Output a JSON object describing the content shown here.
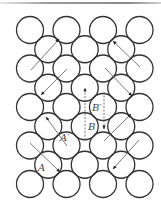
{
  "figure": {
    "title": "",
    "circle_radius": 13.5,
    "stroke_color": "#333333",
    "arrow_color": "#555555",
    "circles": {
      "main_rows_y": [
        30,
        68.5,
        107,
        145.5,
        184
      ],
      "main_rows_x": [
        30,
        66.5,
        103,
        139.5
      ],
      "offset_rows_y": [
        49.25,
        87.75,
        126.25,
        164.75
      ],
      "offset_rows_x": [
        48.25,
        84.75,
        121.25
      ]
    },
    "labels": [
      {
        "id": "A",
        "text": "A",
        "x": 38,
        "y": 171
      },
      {
        "id": "A-prime",
        "text": "A′",
        "x": 60,
        "y": 141
      },
      {
        "id": "B",
        "text": "B",
        "x": 88,
        "y": 130
      },
      {
        "id": "B-prime",
        "text": "B′",
        "x": 92,
        "y": 111
      }
    ],
    "arrows": [
      {
        "name": "slip-arrow-top-left",
        "x1": 31,
        "y1": 70,
        "x2": 59,
        "y2": 39,
        "dashed": false
      },
      {
        "name": "slip-arrow-top-right",
        "x1": 140,
        "y1": 67,
        "x2": 113,
        "y2": 41,
        "dashed": false
      },
      {
        "name": "slip-arrow-mid-left",
        "x1": 67,
        "y1": 69,
        "x2": 41,
        "y2": 95,
        "dashed": false
      },
      {
        "name": "slip-arrow-mid-right",
        "x1": 105,
        "y1": 68,
        "x2": 132,
        "y2": 96,
        "dashed": false
      },
      {
        "name": "slip-arrow-B-up",
        "x1": 85,
        "y1": 140,
        "x2": 85,
        "y2": 88,
        "dashed": true
      },
      {
        "name": "slip-arrow-B-prime-down",
        "x1": 104,
        "y1": 92,
        "x2": 104,
        "y2": 129,
        "dashed": true
      },
      {
        "name": "slip-arrow-A-prime",
        "x1": 67,
        "y1": 146,
        "x2": 46,
        "y2": 117,
        "dashed": false
      },
      {
        "name": "slip-arrow-A",
        "x1": 30,
        "y1": 143,
        "x2": 60,
        "y2": 172,
        "dashed": false
      },
      {
        "name": "slip-arrow-lower-right-up",
        "x1": 104,
        "y1": 141,
        "x2": 131,
        "y2": 114,
        "dashed": false
      },
      {
        "name": "slip-arrow-lower-right-down",
        "x1": 139,
        "y1": 140,
        "x2": 113,
        "y2": 169,
        "dashed": false
      }
    ]
  }
}
